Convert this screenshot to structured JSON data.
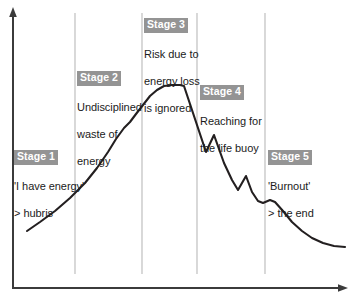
{
  "figure": {
    "name": "burnout-stages-curve",
    "background_color": "#ffffff",
    "curve_color": "#231f20",
    "axis_color": "#3b3b3b",
    "divider_color": "#b9b9b9",
    "label_highlight_color": "#949494",
    "label_text_color": "#ffffff",
    "body_text_color": "#1b1b1b"
  },
  "chart_data": {
    "type": "line",
    "title": "",
    "subtitle": "",
    "xlabel": "",
    "ylabel": "",
    "grid": false,
    "legend": "none",
    "axes": {
      "x_axis": {
        "arrow": true,
        "y_px": 288,
        "x_start_px": 13,
        "x_end_px": 346
      },
      "y_axis": {
        "arrow": true,
        "x_px": 13,
        "y_start_px": 288,
        "y_end_px": 10
      },
      "ticks": [],
      "tick_labels": []
    },
    "series": [
      {
        "name": "Energy level",
        "description": "Energy rises through hubris and undisciplined spending, peaks, then collapses in a jagged descent into burnout.",
        "points_px": [
          [
            27,
            231
          ],
          [
            40,
            222
          ],
          [
            55,
            211
          ],
          [
            70,
            198
          ],
          [
            85,
            183
          ],
          [
            97,
            168
          ],
          [
            108,
            152
          ],
          [
            116,
            139
          ],
          [
            124,
            128
          ],
          [
            130,
            122
          ],
          [
            136,
            114
          ],
          [
            143,
            105
          ],
          [
            150,
            96
          ],
          [
            157,
            90
          ],
          [
            164,
            86
          ],
          [
            172,
            85
          ],
          [
            180,
            85
          ],
          [
            184,
            86
          ],
          [
            192,
            110
          ],
          [
            199,
            131
          ],
          [
            206,
            152
          ],
          [
            214,
            135
          ],
          [
            224,
            163
          ],
          [
            232,
            180
          ],
          [
            238,
            190
          ],
          [
            246,
            176
          ],
          [
            252,
            192
          ],
          [
            258,
            201
          ],
          [
            263,
            203
          ],
          [
            270,
            200
          ],
          [
            275,
            202
          ],
          [
            283,
            211
          ],
          [
            292,
            222
          ],
          [
            302,
            231
          ],
          [
            312,
            238
          ],
          [
            323,
            243
          ],
          [
            334,
            246
          ],
          [
            345,
            247
          ]
        ]
      }
    ],
    "stage_dividers_px": [
      75,
      142,
      197,
      265
    ],
    "divider_top_px": 13,
    "divider_bottom_px": 274
  },
  "stages": [
    {
      "id": "stage-1",
      "title": "Stage 1",
      "body_lines": [
        "'I have energy'",
        "> hubris"
      ],
      "position_px": {
        "left": 14,
        "top": 148
      }
    },
    {
      "id": "stage-2",
      "title": "Stage 2",
      "body_lines": [
        "Undisciplined",
        "waste of",
        "energy"
      ],
      "position_px": {
        "left": 77,
        "top": 69
      }
    },
    {
      "id": "stage-3",
      "title": "Stage 3",
      "body_lines": [
        "Risk due to",
        "energy loss",
        "is ignored"
      ],
      "position_px": {
        "left": 144,
        "top": 16
      }
    },
    {
      "id": "stage-4",
      "title": "Stage 4",
      "body_lines": [
        "Reaching for",
        "the life buoy"
      ],
      "position_px": {
        "left": 200,
        "top": 83
      }
    },
    {
      "id": "stage-5",
      "title": "Stage 5",
      "body_lines": [
        "'Burnout'",
        "> the end"
      ],
      "position_px": {
        "left": 268,
        "top": 148
      }
    }
  ]
}
